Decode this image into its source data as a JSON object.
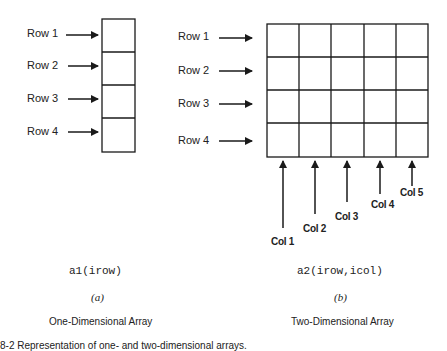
{
  "diagram": {
    "one_d": {
      "row_labels": [
        "Row 1",
        "Row 2",
        "Row 3",
        "Row 4"
      ],
      "code": "a1(irow)",
      "sublabel": "(a)",
      "title": "One-Dimensional Array",
      "rows": 4
    },
    "two_d": {
      "row_labels": [
        "Row 1",
        "Row 2",
        "Row 3",
        "Row 4"
      ],
      "col_labels": [
        "Col 1",
        "Col 2",
        "Col 3",
        "Col 4",
        "Col 5"
      ],
      "code": "a2(irow,icol)",
      "sublabel": "(b)",
      "title": "Two-Dimensional Array",
      "rows": 4,
      "cols": 5
    },
    "caption": "8-2  Representation of one- and two-dimensional arrays."
  },
  "colors": {
    "line": "#1a1a1a",
    "background": "#ffffff"
  }
}
